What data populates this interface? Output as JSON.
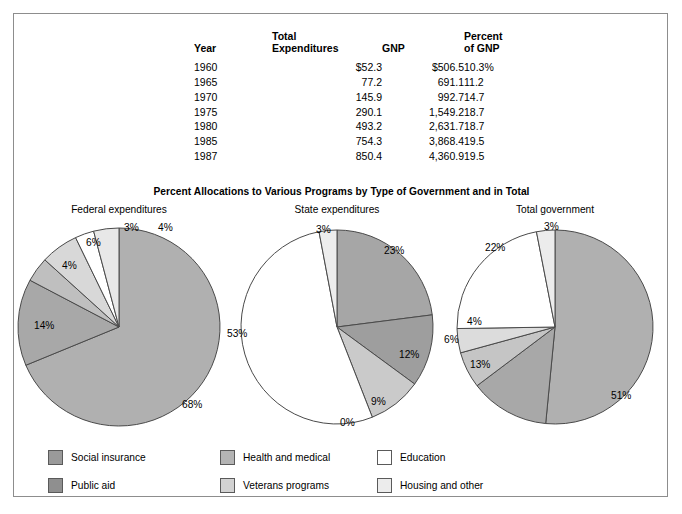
{
  "figure": {
    "subtitle": "Percent Allocations to Various Programs by Type of Government and in Total"
  },
  "table": {
    "headers": {
      "year": "Year",
      "total_expenditures": "Total\nExpenditures",
      "gnp": "GNP",
      "percent_of_gnp": "Percent\nof GNP"
    },
    "rows": [
      {
        "year": "1960",
        "total_expenditures": "$52.3",
        "gnp": "$506.5",
        "percent_of_gnp": "10.3%"
      },
      {
        "year": "1965",
        "total_expenditures": "77.2",
        "gnp": "691.1",
        "percent_of_gnp": "11.2"
      },
      {
        "year": "1970",
        "total_expenditures": "145.9",
        "gnp": "992.7",
        "percent_of_gnp": "14.7"
      },
      {
        "year": "1975",
        "total_expenditures": "290.1",
        "gnp": "1,549.2",
        "percent_of_gnp": "18.7"
      },
      {
        "year": "1980",
        "total_expenditures": "493.2",
        "gnp": "2,631.7",
        "percent_of_gnp": "18.7"
      },
      {
        "year": "1985",
        "total_expenditures": "754.3",
        "gnp": "3,868.4",
        "percent_of_gnp": "19.5"
      },
      {
        "year": "1987",
        "total_expenditures": "850.4",
        "gnp": "4,360.9",
        "percent_of_gnp": "19.5"
      }
    ]
  },
  "legend": {
    "items": [
      {
        "label": "Social insurance",
        "color": "#9a9a9a"
      },
      {
        "label": "Public aid",
        "color": "#8f8f8f"
      },
      {
        "label": "Health and medical",
        "color": "#b4b4b4"
      },
      {
        "label": "Veterans programs",
        "color": "#d2d2d2"
      },
      {
        "label": "Education",
        "color": "#ffffff"
      },
      {
        "label": "Housing and other",
        "color": "#ececec"
      }
    ]
  },
  "chart_data": [
    {
      "type": "pie",
      "title": "Federal expenditures",
      "categories": [
        "Social insurance",
        "Public aid",
        "Health and medical",
        "Veterans programs",
        "Education",
        "Housing and other"
      ],
      "values": [
        68,
        14,
        4,
        6,
        3,
        4
      ],
      "labels": [
        "68%",
        "14%",
        "4%",
        "6%",
        "3%",
        "4%"
      ],
      "colors": [
        "#b0b0b0",
        "#a8a8a8",
        "#bfbfbf",
        "#d8d8d8",
        "#ffffff",
        "#e8e8e8"
      ],
      "start_angle_deg": 0,
      "direction": "clockwise"
    },
    {
      "type": "pie",
      "title": "State expenditures",
      "categories": [
        "Social insurance",
        "Public aid",
        "Health and medical",
        "Veterans programs",
        "Education",
        "Housing and other"
      ],
      "values": [
        23,
        12,
        9,
        0,
        53,
        3
      ],
      "labels": [
        "23%",
        "12%",
        "9%",
        "0%",
        "53%",
        "3%"
      ],
      "colors": [
        "#a6a6a6",
        "#9e9e9e",
        "#cacaca",
        "#dcdcdc",
        "#ffffff",
        "#ededed"
      ],
      "start_angle_deg": 0,
      "direction": "clockwise"
    },
    {
      "type": "pie",
      "title": "Total government",
      "categories": [
        "Social insurance",
        "Public aid",
        "Health and medical",
        "Veterans programs",
        "Education",
        "Housing and other"
      ],
      "values": [
        51,
        13,
        6,
        4,
        22,
        3
      ],
      "labels": [
        "51%",
        "13%",
        "6%",
        "4%",
        "22%",
        "3%"
      ],
      "colors": [
        "#b0b0b0",
        "#a8a8a8",
        "#c5c5c5",
        "#dcdcdc",
        "#ffffff",
        "#ececec"
      ],
      "start_angle_deg": 0,
      "direction": "clockwise"
    }
  ]
}
